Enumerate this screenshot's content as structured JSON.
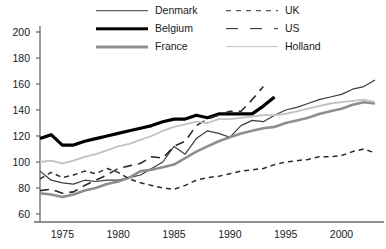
{
  "legend": {
    "entries": [
      {
        "key": "denmark",
        "label": "Denmark",
        "style": "solid",
        "color": "#3c3c3c",
        "col": 1,
        "row": 0
      },
      {
        "key": "belgium",
        "label": "Belgium",
        "style": "solid-thick",
        "color": "#000000",
        "col": 1,
        "row": 1
      },
      {
        "key": "france",
        "label": "France",
        "style": "solid-thick",
        "color": "#8e8e8e",
        "col": 1,
        "row": 2
      },
      {
        "key": "uk",
        "label": "UK",
        "style": "dashed-short",
        "color": "#2b2b2b",
        "col": 2,
        "row": 0
      },
      {
        "key": "us",
        "label": "US",
        "style": "dashed-long",
        "color": "#2b2b2b",
        "col": 2,
        "row": 1
      },
      {
        "key": "holland",
        "label": "Holland",
        "style": "solid",
        "color": "#c2c2c2",
        "col": 2,
        "row": 2
      }
    ]
  },
  "axes": {
    "y_ticks": [
      200,
      180,
      160,
      140,
      120,
      100,
      80,
      60
    ],
    "x_ticks": [
      1975,
      1980,
      1985,
      1990,
      1995,
      2000
    ]
  },
  "chart_data": {
    "type": "line",
    "title": "",
    "xlabel": "",
    "ylabel": "",
    "xlim": [
      1973,
      2003
    ],
    "ylim": [
      60,
      200
    ],
    "grid": false,
    "legend_position": "top",
    "x": [
      1973,
      1974,
      1975,
      1976,
      1977,
      1978,
      1979,
      1980,
      1981,
      1982,
      1983,
      1984,
      1985,
      1986,
      1987,
      1988,
      1989,
      1990,
      1991,
      1992,
      1993,
      1994,
      1995,
      1996,
      1997,
      1998,
      1999,
      2000,
      2001,
      2002,
      2003
    ],
    "series": [
      {
        "name": "Denmark",
        "color": "#3c3c3c",
        "style": "solid",
        "width": 1.2,
        "x": [
          1973,
          1974,
          1975,
          1976,
          1977,
          1978,
          1979,
          1980,
          1981,
          1982,
          1983,
          1984,
          1985,
          1986,
          1987,
          1988,
          1989,
          1990,
          1991,
          1992,
          1993,
          1994,
          1995,
          1996,
          1997,
          1998,
          1999,
          2000,
          2001,
          2002,
          2003
        ],
        "values": [
          93,
          86,
          84,
          83,
          86,
          85,
          86,
          86,
          88,
          90,
          95,
          100,
          112,
          106,
          118,
          124,
          122,
          119,
          128,
          132,
          131,
          136,
          140,
          142,
          145,
          148,
          150,
          152,
          156,
          158,
          163
        ]
      },
      {
        "name": "Belgium",
        "color": "#000000",
        "style": "solid",
        "width": 3.2,
        "x": [
          1973,
          1974,
          1975,
          1976,
          1977,
          1978,
          1979,
          1980,
          1981,
          1982,
          1983,
          1984,
          1985,
          1986,
          1987,
          1988,
          1989,
          1990,
          1991,
          1992,
          1993,
          1994
        ],
        "values": [
          118,
          121,
          113,
          113,
          116,
          118,
          120,
          122,
          124,
          126,
          128,
          131,
          133,
          133,
          136,
          134,
          137,
          137,
          137,
          137,
          143,
          150
        ]
      },
      {
        "name": "France",
        "color": "#8e8e8e",
        "style": "solid",
        "width": 2.6,
        "x": [
          1973,
          1974,
          1975,
          1976,
          1977,
          1978,
          1979,
          1980,
          1981,
          1982,
          1983,
          1984,
          1985,
          1986,
          1987,
          1988,
          1989,
          1990,
          1991,
          1992,
          1993,
          1994,
          1995,
          1996,
          1997,
          1998,
          1999,
          2000,
          2001,
          2002,
          2003
        ],
        "values": [
          76,
          75,
          73,
          75,
          78,
          80,
          83,
          85,
          88,
          93,
          94,
          96,
          98,
          103,
          108,
          112,
          116,
          119,
          122,
          124,
          126,
          127,
          130,
          132,
          134,
          137,
          139,
          141,
          144,
          146,
          145
        ]
      },
      {
        "name": "UK",
        "color": "#2b2b2b",
        "style": "dashed-short",
        "width": 1.5,
        "x": [
          1973,
          1974,
          1975,
          1976,
          1977,
          1978,
          1979,
          1980,
          1981,
          1982,
          1983,
          1984,
          1985,
          1986,
          1987,
          1988,
          1989,
          1990,
          1991,
          1992,
          1993,
          1994,
          1995,
          1996,
          1997,
          1998,
          1999,
          2000,
          2001,
          2002,
          2003
        ],
        "values": [
          87,
          92,
          88,
          90,
          93,
          91,
          95,
          92,
          87,
          84,
          82,
          80,
          79,
          82,
          86,
          88,
          89,
          91,
          93,
          94,
          95,
          98,
          100,
          101,
          102,
          104,
          104,
          105,
          108,
          110,
          107
        ]
      },
      {
        "name": "US",
        "color": "#2b2b2b",
        "style": "dashed-long",
        "width": 1.6,
        "x": [
          1973,
          1974,
          1975,
          1976,
          1977,
          1978,
          1979,
          1980,
          1981,
          1982,
          1983,
          1984,
          1985,
          1986,
          1987,
          1988,
          1989,
          1990,
          1991,
          1992,
          1993
        ],
        "values": [
          78,
          79,
          76,
          77,
          82,
          86,
          90,
          95,
          97,
          99,
          104,
          103,
          112,
          116,
          128,
          133,
          136,
          139,
          139,
          148,
          158
        ]
      },
      {
        "name": "Holland",
        "color": "#c2c2c2",
        "style": "solid",
        "width": 1.8,
        "x": [
          1973,
          1974,
          1975,
          1976,
          1977,
          1978,
          1979,
          1980,
          1981,
          1982,
          1983,
          1984,
          1985,
          1986,
          1987,
          1988,
          1989,
          1990,
          1991,
          1992,
          1993,
          1994,
          1995,
          1996,
          1997,
          1998,
          1999,
          2000,
          2001,
          2002,
          2003
        ],
        "values": [
          100,
          101,
          99,
          101,
          104,
          106,
          109,
          112,
          114,
          117,
          120,
          124,
          127,
          129,
          131,
          130,
          133,
          133,
          134,
          135,
          136,
          136,
          137,
          139,
          141,
          143,
          145,
          146,
          147,
          148,
          146
        ]
      }
    ]
  }
}
